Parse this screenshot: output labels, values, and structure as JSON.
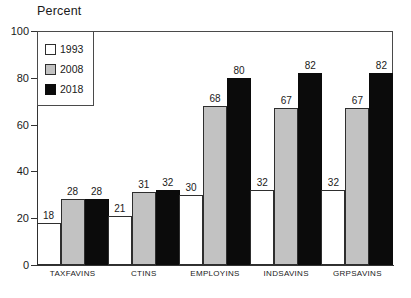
{
  "chart_data": {
    "type": "bar",
    "title": "Percent",
    "xlabel": "",
    "ylabel": "Percent",
    "ylim": [
      0,
      100
    ],
    "yticks": [
      0,
      20,
      40,
      60,
      80,
      100
    ],
    "grid": false,
    "legend_position": "top-left-inside",
    "categories": [
      "TAXFAVINS",
      "CTINS",
      "EMPLOYINS",
      "INDSAVINS",
      "GRPSAVINS"
    ],
    "series": [
      {
        "name": "1993",
        "color": "#ffffff",
        "values": [
          18,
          21,
          30,
          32,
          32
        ]
      },
      {
        "name": "2008",
        "color": "#c2c2c2",
        "values": [
          28,
          31,
          68,
          67,
          67
        ]
      },
      {
        "name": "2018",
        "color": "#0b0b0b",
        "values": [
          28,
          32,
          80,
          82,
          82
        ]
      }
    ],
    "data_labels": [
      [
        "18",
        "28",
        "28"
      ],
      [
        "21",
        "31",
        "32"
      ],
      [
        "30",
        "68",
        "80"
      ],
      [
        "32",
        "67",
        "82"
      ],
      [
        "32",
        "67",
        "82"
      ]
    ]
  },
  "axis": {
    "y_tick_labels": [
      "100",
      "80",
      "60",
      "40",
      "20",
      "0"
    ]
  },
  "legend": {
    "entries": [
      {
        "label": "1993"
      },
      {
        "label": "2008"
      },
      {
        "label": "2018"
      }
    ]
  }
}
